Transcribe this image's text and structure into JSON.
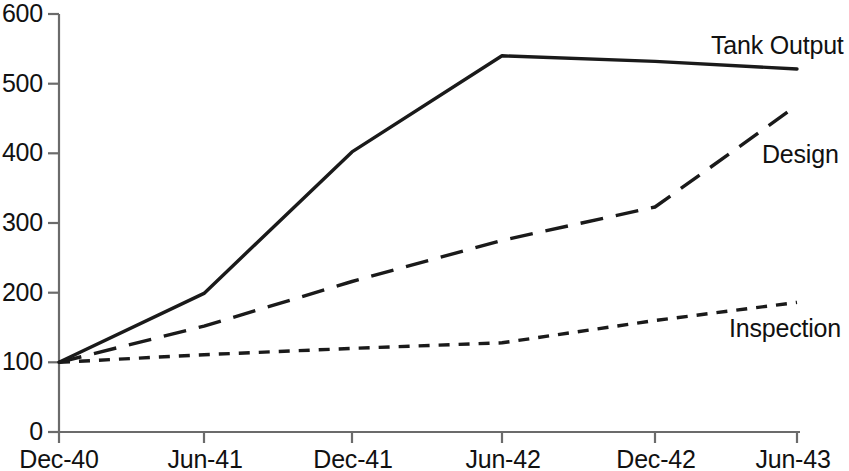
{
  "chart_data": {
    "type": "line",
    "title": "",
    "subtitle": "",
    "xlabel": "",
    "ylabel": "",
    "categories": [
      "Dec-40",
      "Jun-41",
      "Dec-41",
      "Jun-42",
      "Dec-42",
      "Jun-43"
    ],
    "x_tick_labels": [
      "Dec-40",
      "Jun-41",
      "Dec-41",
      "Jun-42",
      "Dec-42",
      "Jun-43"
    ],
    "y_tick_labels": [
      "0",
      "100",
      "200",
      "300",
      "400",
      "500",
      "600"
    ],
    "y_ticks": [
      0,
      100,
      200,
      300,
      400,
      500,
      600
    ],
    "ylim": [
      0,
      600
    ],
    "grid": false,
    "legend_position": "inline-right-of-line-ends",
    "axis_color": "#555555",
    "line_color": "#1a1a1a",
    "background": "#ffffff",
    "series": [
      {
        "name": "Tank Output",
        "label": "Tank Output",
        "style": "solid",
        "values": [
          100,
          199,
          402,
          540,
          532,
          521
        ]
      },
      {
        "name": "Design",
        "label": "Design",
        "style": "long-dash",
        "values": [
          100,
          152,
          216,
          275,
          323,
          469
        ]
      },
      {
        "name": "Inspection",
        "label": "Inspection",
        "style": "short-dash",
        "values": [
          100,
          111,
          120,
          128,
          160,
          186
        ]
      }
    ]
  },
  "labels": {
    "tank_output": "Tank Output",
    "design": "Design",
    "inspection": "Inspection"
  },
  "y_axis": {
    "t0": "0",
    "t100": "100",
    "t200": "200",
    "t300": "300",
    "t400": "400",
    "t500": "500",
    "t600": "600"
  },
  "x_axis": {
    "t0": "Dec-40",
    "t1": "Jun-41",
    "t2": "Dec-41",
    "t3": "Jun-42",
    "t4": "Dec-42",
    "t5": "Jun-43"
  }
}
